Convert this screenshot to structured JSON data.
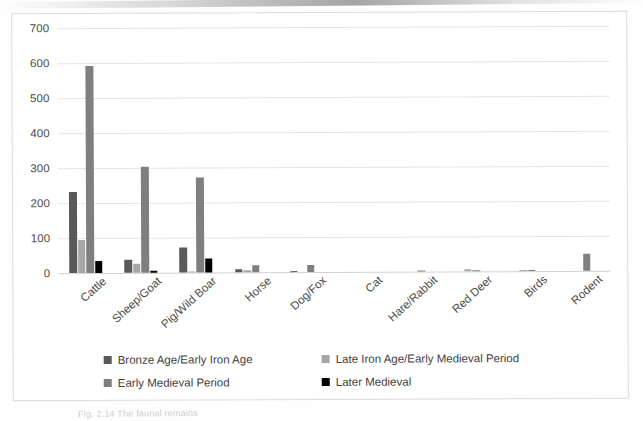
{
  "figure": {
    "caption": "Fig. 2.14  The faunal remains",
    "frame_border_color": "#dcdcdc"
  },
  "chart_data": {
    "type": "bar",
    "title": "",
    "subtitle": "",
    "xlabel": "",
    "ylabel": "",
    "ylim": [
      0,
      700
    ],
    "y_ticks": [
      0,
      100,
      200,
      300,
      400,
      500,
      600,
      700
    ],
    "grid": true,
    "grid_axis": "y",
    "legend_position": "bottom",
    "orientation": "vertical",
    "categories": [
      "Cattle",
      "Sheep/Goat",
      "Pig/Wild Boar",
      "Horse",
      "Dog/Fox",
      "Cat",
      "Hare/Rabbit",
      "Red Deer",
      "Birds",
      "Rodent"
    ],
    "series": [
      {
        "name": "Bronze Age/Early Iron Age",
        "color": "#595959",
        "values": [
          232,
          38,
          72,
          10,
          4,
          0,
          0,
          0,
          0,
          0
        ]
      },
      {
        "name": "Late Iron Age/Early Medieval Period",
        "color": "#a6a6a6",
        "values": [
          95,
          27,
          3,
          5,
          0,
          0,
          0,
          6,
          2,
          0
        ]
      },
      {
        "name": "Early Medieval Period",
        "color": "#7f7f7f",
        "values": [
          591,
          303,
          272,
          20,
          19,
          0,
          2,
          3,
          2,
          50
        ]
      },
      {
        "name": "Later Medieval",
        "color": "#000000",
        "values": [
          33,
          7,
          40,
          0,
          0,
          0,
          0,
          0,
          0,
          0
        ]
      }
    ]
  }
}
